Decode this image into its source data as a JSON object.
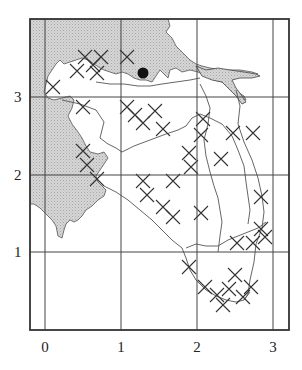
{
  "map": {
    "type": "grid-map",
    "frame": {
      "x": 30,
      "y": 19,
      "width": 259,
      "height": 311
    },
    "x_ticks": [
      {
        "label": "0",
        "px": 45
      },
      {
        "label": "1",
        "px": 121
      },
      {
        "label": "2",
        "px": 197
      },
      {
        "label": "3",
        "px": 273
      }
    ],
    "y_ticks": [
      {
        "label": "1",
        "px": 252
      },
      {
        "label": "2",
        "px": 175
      },
      {
        "label": "3",
        "px": 97
      }
    ],
    "colors": {
      "water": "#cfcfcf",
      "line": "#333333",
      "grid": "#444444",
      "marker": "#111111",
      "background": "#ffffff"
    },
    "marker": {
      "label": "site",
      "x": 143,
      "y": 73,
      "r": 5
    },
    "legend": "Shaded = water; X = occurrence grid cell markers"
  }
}
